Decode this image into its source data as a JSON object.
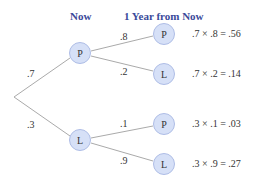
{
  "headers": {
    "now": "Now",
    "future": "1 Year from Now"
  },
  "first_level": [
    {
      "node": "P",
      "prob": ".7"
    },
    {
      "node": "L",
      "prob": ".3"
    }
  ],
  "second_level": [
    {
      "parent": "P",
      "node": "P",
      "prob": ".8",
      "result": ".7 × .8 = .56"
    },
    {
      "parent": "P",
      "node": "L",
      "prob": ".2",
      "result": ".7 × .2 = .14"
    },
    {
      "parent": "L",
      "node": "P",
      "prob": ".1",
      "result": ".3 × .1 = .03"
    },
    {
      "parent": "L",
      "node": "L",
      "prob": ".9",
      "result": ".3 × .9 = .27"
    }
  ],
  "colors": {
    "header": "#3a4a9a",
    "node_fill": "#d6e0f7",
    "edge": "#aaaaaa"
  }
}
